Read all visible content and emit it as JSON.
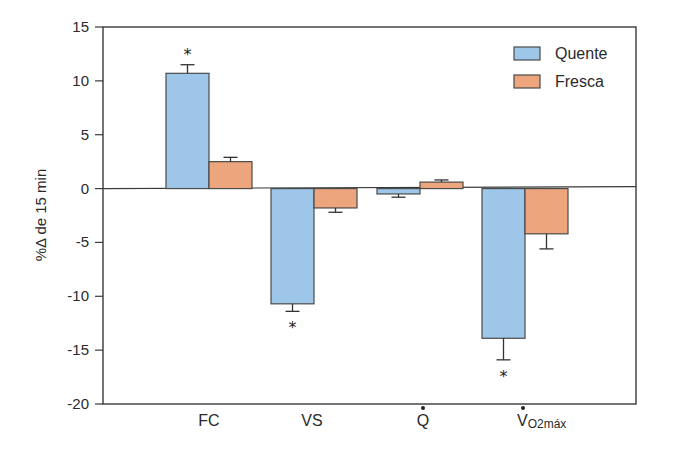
{
  "chart_data": {
    "type": "bar",
    "title": "",
    "xlabel": "",
    "ylabel": "%Δ de 15 min",
    "ylim": [
      -20,
      15
    ],
    "yticks": [
      15,
      10,
      5,
      0,
      -5,
      -10,
      -15,
      -20
    ],
    "grid": false,
    "legend_position": "top-right",
    "categories": [
      "FC",
      "VS",
      "Q̇",
      "V̇O2máx"
    ],
    "category_display": [
      {
        "main": "FC",
        "dot": false,
        "sub": ""
      },
      {
        "main": "VS",
        "dot": false,
        "sub": ""
      },
      {
        "main": "Q",
        "dot": true,
        "sub": ""
      },
      {
        "main": "V",
        "dot": true,
        "sub": "O2máx"
      }
    ],
    "series": [
      {
        "name": "Quente",
        "color": "#9ec6e8",
        "values": [
          10.7,
          -10.7,
          -0.5,
          -13.9
        ],
        "error": [
          0.8,
          0.7,
          0.3,
          2.0
        ],
        "significant": [
          true,
          true,
          false,
          true
        ]
      },
      {
        "name": "Fresca",
        "color": "#eda57e",
        "values": [
          2.5,
          -1.8,
          0.6,
          -4.2
        ],
        "error": [
          0.4,
          0.4,
          0.2,
          1.4
        ],
        "significant": [
          false,
          false,
          false,
          false
        ]
      }
    ],
    "annotations": [
      "*"
    ]
  }
}
